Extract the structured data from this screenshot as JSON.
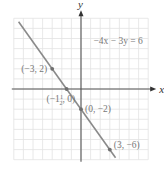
{
  "chart_data": {
    "type": "line",
    "title": "",
    "equation": "−4x − 3y = 6",
    "xlabel": "x",
    "ylabel": "y",
    "xlim": [
      -7,
      7
    ],
    "ylim": [
      -7,
      7
    ],
    "grid": true,
    "grid_step": 1,
    "series": [
      {
        "name": "−4x − 3y = 6",
        "slope": -1.3333,
        "intercept": -2,
        "x_range": [
          -6.5,
          3.6
        ]
      }
    ],
    "points": [
      {
        "x": -3,
        "y": 2,
        "label": "(−3, 2)"
      },
      {
        "x": -1.5,
        "y": 0,
        "label_prefix": "(−1",
        "label_frac_num": "1",
        "label_frac_den": "2",
        "label_suffix": ", 0)"
      },
      {
        "x": 0,
        "y": -2,
        "label": "(0, −2)"
      },
      {
        "x": 3,
        "y": -6,
        "label": "(3, −6)"
      }
    ]
  }
}
